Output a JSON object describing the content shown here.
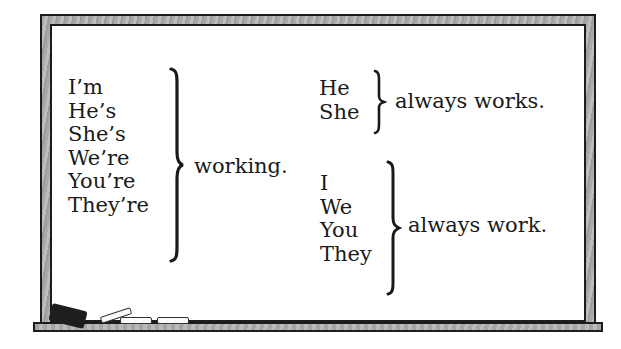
{
  "board": {
    "left_group": {
      "subjects": [
        "I’m",
        "He’s",
        "She’s",
        "We’re",
        "You’re",
        "They’re"
      ],
      "predicate": "working."
    },
    "right_top_group": {
      "subjects": [
        "He",
        "She"
      ],
      "predicate": "always works."
    },
    "right_bottom_group": {
      "subjects": [
        "I",
        "We",
        "You",
        "They"
      ],
      "predicate": "always work."
    }
  },
  "decor": {
    "items": [
      "eraser-icon",
      "chalk-icon",
      "chalk-icon",
      "chalk-icon"
    ]
  },
  "colors": {
    "frame": "#a9a9a9",
    "board": "#ffffff",
    "ink": "#1a1a1a"
  }
}
